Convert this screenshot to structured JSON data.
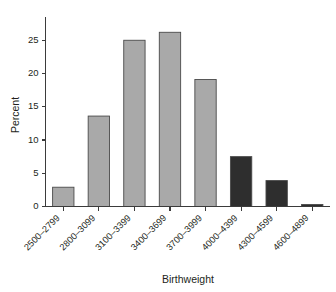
{
  "chart_data": {
    "type": "bar",
    "title": "",
    "subtitle": "",
    "xlabel": "Birthweight",
    "ylabel": "Percent",
    "categories": [
      "2500–2799",
      "2800–3099",
      "3100–3399",
      "3400–3699",
      "3700–3999",
      "4000–4399",
      "4300–4599",
      "4600–4899"
    ],
    "values": [
      2.9,
      13.6,
      25.0,
      26.2,
      19.1,
      7.5,
      3.9,
      0.3
    ],
    "bar_colors": [
      "#a9a9a9",
      "#a9a9a9",
      "#a9a9a9",
      "#a9a9a9",
      "#a9a9a9",
      "#2e2e2e",
      "#2e2e2e",
      "#2e2e2e"
    ],
    "bar_edge_color": "#4a4a4a",
    "ylim": [
      0,
      28.5
    ],
    "yticks": [
      0,
      5,
      10,
      15,
      20,
      25
    ],
    "ytick_labels": [
      "0",
      "5",
      "10",
      "15",
      "20",
      "25"
    ],
    "grid": false,
    "legend": null,
    "xtick_rotation_deg": 45,
    "axis_color": "#3b3b3b",
    "background_color": "#ffffff"
  }
}
